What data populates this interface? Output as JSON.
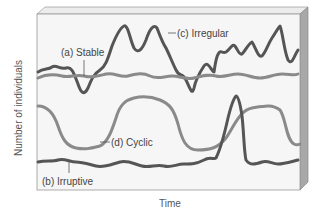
{
  "diagram": {
    "title": "",
    "axes": {
      "x_label": "Time",
      "y_label": "Number of individuals"
    },
    "curves": [
      {
        "id": "stable",
        "label": "(a) Stable",
        "color": "#8a8a8a",
        "description": "nearly flat with small oscillations"
      },
      {
        "id": "irruptive",
        "label": "(b) Irruptive",
        "color": "#555555",
        "description": "low and flat with one sharp spike"
      },
      {
        "id": "irregular",
        "label": "(c) Irregular",
        "color": "#555555",
        "description": "large unpredictable fluctuations"
      },
      {
        "id": "cyclic",
        "label": "(d) Cyclic",
        "color": "#8a8a8a",
        "description": "smooth regular oscillation"
      }
    ],
    "colors": {
      "background": "#ffffff",
      "panel_face": "#f4f4f4",
      "panel_side": "#a8a8a8",
      "panel_top": "#e6e6e6",
      "dark_line": "#555555",
      "light_line": "#8a8a8a"
    }
  }
}
